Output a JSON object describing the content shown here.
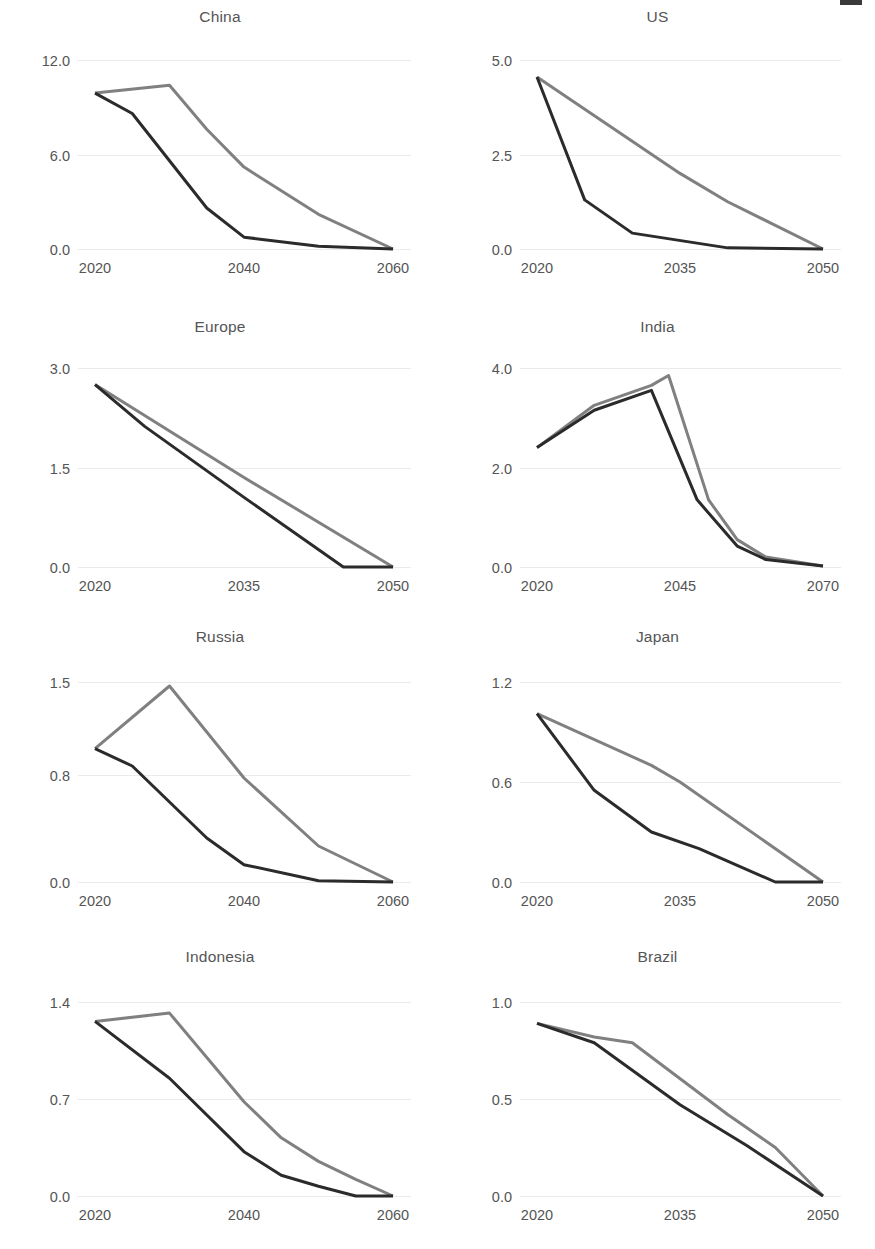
{
  "figure": {
    "panel_count": 8,
    "columns": 2,
    "rows": 4,
    "series_colors": {
      "dark": "#2b2b2b",
      "gray": "#808080"
    },
    "gridline_color": "#ebebeb",
    "text_color": "#555555"
  },
  "chart_data": [
    {
      "type": "line",
      "title": "China",
      "xlabel": "",
      "ylabel": "",
      "xlim": [
        2020,
        2060
      ],
      "ylim": [
        0,
        12
      ],
      "xticks": [
        2020,
        2040,
        2060
      ],
      "xtick_labels": [
        "2020",
        "2040",
        "2060"
      ],
      "yticks": [
        0.0,
        6.0,
        12.0
      ],
      "ytick_labels": [
        "0.0",
        "6.0",
        "12.0"
      ],
      "grid": true,
      "legend": "none",
      "series": [
        {
          "name": "gray",
          "color": "#808080",
          "x": [
            2020,
            2030,
            2035,
            2040,
            2050,
            2060
          ],
          "values": [
            9.9,
            10.4,
            7.6,
            5.2,
            2.2,
            0.0
          ]
        },
        {
          "name": "dark",
          "color": "#2b2b2b",
          "x": [
            2020,
            2025,
            2035,
            2040,
            2050,
            2060
          ],
          "values": [
            9.9,
            8.6,
            2.6,
            0.75,
            0.18,
            0.0
          ]
        }
      ]
    },
    {
      "type": "line",
      "title": "US",
      "xlabel": "",
      "ylabel": "",
      "xlim": [
        2020,
        2050
      ],
      "ylim": [
        0,
        5
      ],
      "xticks": [
        2020,
        2035,
        2050
      ],
      "xtick_labels": [
        "2020",
        "2035",
        "2050"
      ],
      "yticks": [
        0.0,
        2.5,
        5.0
      ],
      "ytick_labels": [
        "0.0",
        "2.5",
        "5.0"
      ],
      "grid": true,
      "legend": "none",
      "series": [
        {
          "name": "gray",
          "color": "#808080",
          "x": [
            2020,
            2035,
            2040,
            2050
          ],
          "values": [
            4.55,
            2.0,
            1.25,
            0.0
          ]
        },
        {
          "name": "dark",
          "color": "#2b2b2b",
          "x": [
            2020,
            2025,
            2030,
            2040,
            2050
          ],
          "values": [
            4.55,
            1.3,
            0.42,
            0.03,
            0.0
          ]
        }
      ]
    },
    {
      "type": "line",
      "title": "Europe",
      "xlabel": "",
      "ylabel": "",
      "xlim": [
        2020,
        2050
      ],
      "ylim": [
        0,
        3
      ],
      "xticks": [
        2020,
        2035,
        2050
      ],
      "xtick_labels": [
        "2020",
        "2035",
        "2050"
      ],
      "yticks": [
        0.0,
        1.5,
        3.0
      ],
      "ytick_labels": [
        "0.0",
        "1.5",
        "3.0"
      ],
      "grid": true,
      "legend": "none",
      "series": [
        {
          "name": "gray",
          "color": "#808080",
          "x": [
            2020,
            2035,
            2050
          ],
          "values": [
            2.75,
            1.35,
            0.0
          ]
        },
        {
          "name": "dark",
          "color": "#2b2b2b",
          "x": [
            2020,
            2025,
            2035,
            2045,
            2050
          ],
          "values": [
            2.75,
            2.12,
            1.05,
            0.0,
            0.0
          ]
        }
      ]
    },
    {
      "type": "line",
      "title": "India",
      "xlabel": "",
      "ylabel": "",
      "xlim": [
        2020,
        2070
      ],
      "ylim": [
        0,
        4
      ],
      "xticks": [
        2020,
        2045,
        2070
      ],
      "xtick_labels": [
        "2020",
        "2045",
        "2070"
      ],
      "yticks": [
        0.0,
        2.0,
        4.0
      ],
      "ytick_labels": [
        "0.0",
        "2.0",
        "4.0"
      ],
      "grid": true,
      "legend": "none",
      "series": [
        {
          "name": "gray",
          "color": "#808080",
          "x": [
            2020,
            2030,
            2040,
            2043,
            2050,
            2055,
            2060,
            2070
          ],
          "values": [
            2.4,
            3.25,
            3.65,
            3.85,
            1.35,
            0.55,
            0.2,
            0.02
          ]
        },
        {
          "name": "dark",
          "color": "#2b2b2b",
          "x": [
            2020,
            2030,
            2040,
            2048,
            2055,
            2060,
            2070
          ],
          "values": [
            2.4,
            3.15,
            3.55,
            1.35,
            0.42,
            0.15,
            0.02
          ]
        }
      ]
    },
    {
      "type": "line",
      "title": "Russia",
      "xlabel": "",
      "ylabel": "",
      "xlim": [
        2020,
        2060
      ],
      "ylim": [
        0,
        1.5
      ],
      "xticks": [
        2020,
        2040,
        2060
      ],
      "xtick_labels": [
        "2020",
        "2040",
        "2060"
      ],
      "yticks": [
        0.0,
        0.8,
        1.5
      ],
      "ytick_labels": [
        "0.0",
        "0.8",
        "1.5"
      ],
      "grid": true,
      "legend": "none",
      "series": [
        {
          "name": "gray",
          "color": "#808080",
          "x": [
            2020,
            2030,
            2040,
            2050,
            2060
          ],
          "values": [
            1.0,
            1.47,
            0.78,
            0.27,
            0.0
          ]
        },
        {
          "name": "dark",
          "color": "#2b2b2b",
          "x": [
            2020,
            2025,
            2035,
            2040,
            2050,
            2060
          ],
          "values": [
            1.0,
            0.87,
            0.33,
            0.13,
            0.01,
            0.0
          ]
        }
      ]
    },
    {
      "type": "line",
      "title": "Japan",
      "xlabel": "",
      "ylabel": "",
      "xlim": [
        2020,
        2050
      ],
      "ylim": [
        0,
        1.2
      ],
      "xticks": [
        2020,
        2035,
        2050
      ],
      "xtick_labels": [
        "2020",
        "2035",
        "2050"
      ],
      "yticks": [
        0.0,
        0.6,
        1.2
      ],
      "ytick_labels": [
        "0.0",
        "0.6",
        "1.2"
      ],
      "grid": true,
      "legend": "none",
      "series": [
        {
          "name": "gray",
          "color": "#808080",
          "x": [
            2020,
            2032,
            2035,
            2050
          ],
          "values": [
            1.01,
            0.7,
            0.6,
            0.0
          ]
        },
        {
          "name": "dark",
          "color": "#2b2b2b",
          "x": [
            2020,
            2026,
            2032,
            2037,
            2045,
            2050
          ],
          "values": [
            1.01,
            0.55,
            0.3,
            0.2,
            0.0,
            0.0
          ]
        }
      ]
    },
    {
      "type": "line",
      "title": "Indonesia",
      "xlabel": "",
      "ylabel": "",
      "xlim": [
        2020,
        2060
      ],
      "ylim": [
        0,
        1.4
      ],
      "xticks": [
        2020,
        2040,
        2060
      ],
      "xtick_labels": [
        "2020",
        "2040",
        "2060"
      ],
      "yticks": [
        0.0,
        0.7,
        1.4
      ],
      "ytick_labels": [
        "0.0",
        "0.7",
        "1.4"
      ],
      "grid": true,
      "legend": "none",
      "series": [
        {
          "name": "gray",
          "color": "#808080",
          "x": [
            2020,
            2030,
            2040,
            2045,
            2050,
            2055,
            2060
          ],
          "values": [
            1.26,
            1.32,
            0.68,
            0.42,
            0.25,
            0.12,
            0.0
          ]
        },
        {
          "name": "dark",
          "color": "#2b2b2b",
          "x": [
            2020,
            2030,
            2040,
            2045,
            2050,
            2055,
            2060
          ],
          "values": [
            1.26,
            0.85,
            0.32,
            0.15,
            0.07,
            0.0,
            0.0
          ]
        }
      ]
    },
    {
      "type": "line",
      "title": "Brazil",
      "xlabel": "",
      "ylabel": "",
      "xlim": [
        2020,
        2050
      ],
      "ylim": [
        0,
        1.0
      ],
      "xticks": [
        2020,
        2035,
        2050
      ],
      "xtick_labels": [
        "2020",
        "2035",
        "2050"
      ],
      "yticks": [
        0.0,
        0.5,
        1.0
      ],
      "ytick_labels": [
        "0.0",
        "0.5",
        "1.0"
      ],
      "grid": true,
      "legend": "none",
      "series": [
        {
          "name": "gray",
          "color": "#808080",
          "x": [
            2020,
            2026,
            2030,
            2040,
            2045,
            2050
          ],
          "values": [
            0.89,
            0.82,
            0.79,
            0.42,
            0.25,
            0.0
          ]
        },
        {
          "name": "dark",
          "color": "#2b2b2b",
          "x": [
            2020,
            2026,
            2035,
            2042,
            2050
          ],
          "values": [
            0.89,
            0.79,
            0.47,
            0.26,
            0.0
          ]
        }
      ]
    }
  ]
}
